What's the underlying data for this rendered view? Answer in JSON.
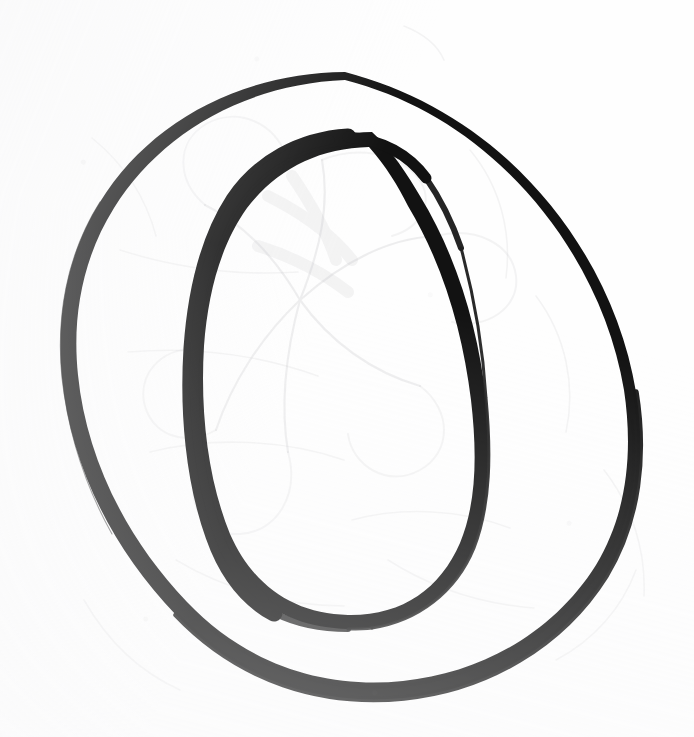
{
  "document": {
    "kind": "scanned-drawing",
    "title": "Hand-drawn letter O",
    "medium": "ink on paper",
    "background_color": "#fefefe",
    "ink_color": "#121212",
    "ghost_color": "#c9c9cc",
    "width": 694,
    "height": 737
  },
  "artwork": {
    "subject": "letter-o",
    "glyph": "O",
    "style": "roman serif capital, two-contour outline drawing",
    "description": "An uppercase letter O drawn as two concentric ovals. The outer contour is a thin pen line that swells toward the lower right. The inner counter is drawn with a very heavy stroke down its left flank that tapers away toward the top right and toward the bottom.",
    "contours": [
      {
        "name": "outer-oval",
        "bounds": {
          "left": 58,
          "top": 72,
          "right": 641,
          "bottom": 700
        },
        "stroke_min_px": 2,
        "stroke_max_px": 8,
        "heaviest_at": "bottom-right",
        "lightest_at": "top-left"
      },
      {
        "name": "inner-oval-counter",
        "bounds": {
          "left": 186,
          "top": 132,
          "right": 490,
          "bottom": 630
        },
        "stroke_min_px": 3,
        "stroke_max_px": 22,
        "heaviest_at": "left-flank",
        "lightest_at": "top-right"
      }
    ],
    "ghost_marks": {
      "present": true,
      "description": "Faint graphite / bleed-through lines from a floral drawing on the reverse of the sheet, visible across the middle and upper-left of the page.",
      "motif": "flower petals and stems"
    }
  },
  "colors": {
    "paper": "#fefefe",
    "ink": "#121212",
    "ink_soft": "#1d1d1d",
    "ghost": "#c9c9cc",
    "ghost_faint": "#dedee1"
  }
}
